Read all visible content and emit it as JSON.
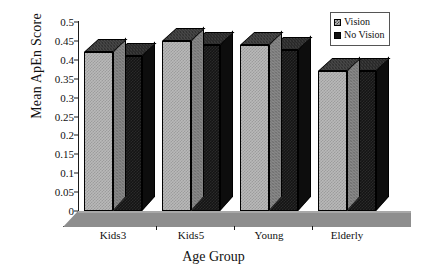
{
  "chart_data": {
    "type": "bar",
    "title": "",
    "subtitle": "",
    "xlabel": "Age Group",
    "ylabel": "Mean ApEn Score",
    "categories": [
      "Kids3",
      "Kids5",
      "Young",
      "Elderly"
    ],
    "series": [
      {
        "name": "Vision",
        "values": [
          0.42,
          0.45,
          0.44,
          0.37
        ],
        "color": "#b9b9b9"
      },
      {
        "name": "No Vision",
        "values": [
          0.41,
          0.44,
          0.425,
          0.37
        ],
        "color": "#141414"
      }
    ],
    "ylim": [
      0,
      0.5
    ],
    "ytick_values": [
      0,
      0.05,
      0.1,
      0.15,
      0.2,
      0.25,
      0.3,
      0.35,
      0.4,
      0.45,
      0.5
    ],
    "ytick_labels": [
      "0",
      "0.05",
      "0.1",
      "0.15",
      "0.2",
      "0.25",
      "0.3",
      "0.35",
      "0.4",
      "0.45",
      "0.5"
    ],
    "grid": false,
    "legend_position": "top-right",
    "style": "3d-bar"
  },
  "legend": {
    "entries": [
      {
        "label": "Vision"
      },
      {
        "label": "No Vision"
      }
    ]
  }
}
